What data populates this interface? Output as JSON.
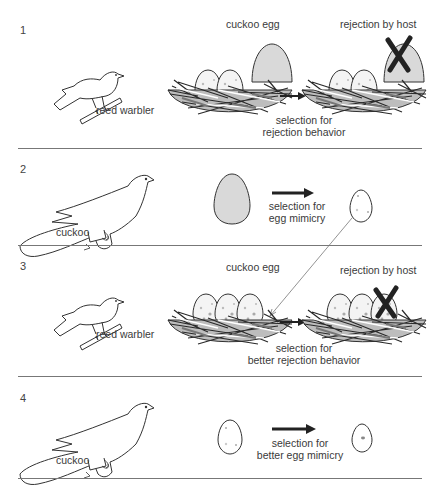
{
  "panels": [
    {
      "number": "1",
      "bird_label": "reed warbler",
      "egg_label": "cuckoo egg",
      "rejection_label": "rejection by host",
      "selection_line1": "selection for",
      "selection_line2": "rejection behavior"
    },
    {
      "number": "2",
      "bird_label": "cuckoo",
      "selection_line1": "selection for",
      "selection_line2": "egg mimicry"
    },
    {
      "number": "3",
      "bird_label": "reed warbler",
      "egg_label": "cuckoo egg",
      "rejection_label": "rejection by host",
      "selection_line1": "selection for",
      "selection_line2": "better rejection behavior"
    },
    {
      "number": "4",
      "bird_label": "cuckoo",
      "selection_line1": "selection for",
      "selection_line2": "better egg mimicry"
    }
  ],
  "colors": {
    "cuckoo_egg_fill": "#d9d9d9",
    "host_egg_fill": "#f2f2f2",
    "reject_x": "#222222",
    "rule": "#777777"
  }
}
